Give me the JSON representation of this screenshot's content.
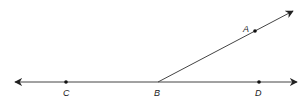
{
  "diagram": {
    "type": "geometry-angle",
    "line_color": "#222222",
    "points": {
      "A": {
        "label": "A",
        "x": 255,
        "y": 31
      },
      "B": {
        "label": "B",
        "x": 158,
        "y": 82
      },
      "C": {
        "label": "C",
        "x": 66,
        "y": 82
      },
      "D": {
        "label": "D",
        "x": 259,
        "y": 82
      }
    },
    "line": {
      "description": "Line CD through B with arrows at both ends"
    },
    "ray": {
      "description": "Ray BA starting at B through A"
    }
  }
}
